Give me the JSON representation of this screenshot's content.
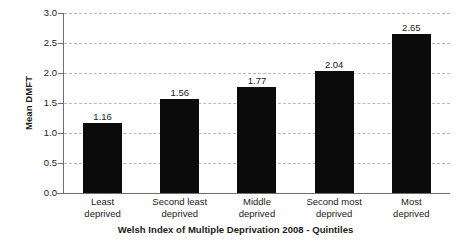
{
  "chart_data": {
    "type": "bar",
    "title": "",
    "xlabel": "Welsh Index of Multiple Deprivation 2008 - Quintiles",
    "ylabel": "Mean DMFT",
    "categories": [
      "Least deprived",
      "Second least deprived",
      "Middle deprived",
      "Second most deprived",
      "Most deprived"
    ],
    "category_lines": [
      [
        "Least",
        "deprived"
      ],
      [
        "Second least",
        "deprived"
      ],
      [
        "Middle",
        "deprived"
      ],
      [
        "Second most",
        "deprived"
      ],
      [
        "Most",
        "deprived"
      ]
    ],
    "values": [
      1.16,
      1.56,
      1.77,
      2.04,
      2.65
    ],
    "value_labels": [
      "1.16",
      "1.56",
      "1.77",
      "2.04",
      "2.65"
    ],
    "ylim": [
      0.0,
      3.0
    ],
    "ytick_values": [
      3.0,
      2.5,
      2.0,
      1.5,
      1.0,
      0.5,
      0.0
    ],
    "ytick_labels": [
      "3.0",
      "2.5",
      "2.0",
      "1.5",
      "1.0",
      "0.5",
      "0.0"
    ],
    "grid": true,
    "grid_style": "dashed",
    "legend": "none",
    "bar_color": "#0b0b0b",
    "grid_color": "#b9b9b9",
    "axis_color": "#6e6e6e",
    "background_color": "#ffffff"
  }
}
